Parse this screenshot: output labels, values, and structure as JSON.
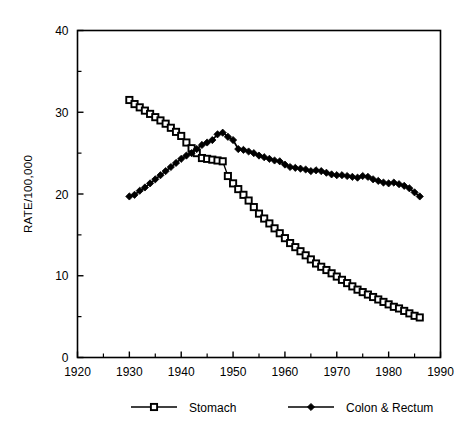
{
  "chart_data": {
    "type": "line",
    "title": "",
    "subtitle": "",
    "xlabel": "",
    "ylabel": "RATE/100,000",
    "xlim": [
      1920,
      1990
    ],
    "ylim": [
      0,
      40
    ],
    "x_ticks": [
      1920,
      1930,
      1940,
      1950,
      1960,
      1970,
      1980,
      1990
    ],
    "x_tick_labels": [
      "1920",
      "1930",
      "1940",
      "1950",
      "1960",
      "1970",
      "1980",
      "1990"
    ],
    "x_minor_ticks": [
      1925,
      1935,
      1945,
      1955,
      1965,
      1975,
      1985
    ],
    "y_ticks": [
      0,
      10,
      20,
      30,
      40
    ],
    "y_tick_labels": [
      "0",
      "10",
      "20",
      "30",
      "40"
    ],
    "y_minor_ticks": [
      5,
      15,
      25,
      35
    ],
    "grid": false,
    "legend_position": "bottom",
    "frame": "full-box",
    "series": [
      {
        "name": "Stomach",
        "marker": "open-square",
        "color": "#000000",
        "x": [
          1930,
          1931,
          1932,
          1933,
          1934,
          1935,
          1936,
          1937,
          1938,
          1939,
          1940,
          1941,
          1942,
          1943,
          1944,
          1945,
          1946,
          1947,
          1948,
          1949,
          1950,
          1951,
          1952,
          1953,
          1954,
          1955,
          1956,
          1957,
          1958,
          1959,
          1960,
          1961,
          1962,
          1963,
          1964,
          1965,
          1966,
          1967,
          1968,
          1969,
          1970,
          1971,
          1972,
          1973,
          1974,
          1975,
          1976,
          1977,
          1978,
          1979,
          1980,
          1981,
          1982,
          1983,
          1984,
          1985,
          1986
        ],
        "values": [
          31.5,
          31.0,
          30.6,
          30.2,
          29.8,
          29.4,
          29.0,
          28.6,
          28.1,
          27.6,
          27.1,
          26.3,
          25.6,
          25.0,
          24.4,
          24.3,
          24.2,
          24.1,
          24.0,
          22.2,
          21.3,
          20.6,
          19.9,
          19.2,
          18.4,
          17.6,
          17.0,
          16.4,
          15.8,
          15.2,
          14.6,
          14.0,
          13.5,
          13.0,
          12.5,
          12.0,
          11.5,
          11.1,
          10.7,
          10.3,
          9.9,
          9.5,
          9.1,
          8.7,
          8.3,
          8.0,
          7.7,
          7.4,
          7.1,
          6.8,
          6.5,
          6.2,
          6.0,
          5.7,
          5.4,
          5.1,
          4.9
        ]
      },
      {
        "name": "Colon & Rectum",
        "marker": "filled-diamond",
        "color": "#000000",
        "x": [
          1930,
          1931,
          1932,
          1933,
          1934,
          1935,
          1936,
          1937,
          1938,
          1939,
          1940,
          1941,
          1942,
          1943,
          1944,
          1945,
          1946,
          1947,
          1948,
          1949,
          1950,
          1951,
          1952,
          1953,
          1954,
          1955,
          1956,
          1957,
          1958,
          1959,
          1960,
          1961,
          1962,
          1963,
          1964,
          1965,
          1966,
          1967,
          1968,
          1969,
          1970,
          1971,
          1972,
          1973,
          1974,
          1975,
          1976,
          1977,
          1978,
          1979,
          1980,
          1981,
          1982,
          1983,
          1984,
          1985,
          1986
        ],
        "values": [
          19.7,
          19.9,
          20.4,
          20.8,
          21.3,
          21.8,
          22.3,
          22.8,
          23.3,
          23.8,
          24.3,
          24.7,
          25.0,
          25.5,
          26.0,
          26.3,
          26.6,
          27.3,
          27.5,
          27.0,
          26.6,
          25.5,
          25.4,
          25.2,
          25.0,
          24.7,
          24.5,
          24.3,
          24.1,
          24.0,
          23.6,
          23.3,
          23.2,
          23.1,
          23.0,
          22.8,
          22.9,
          22.8,
          22.6,
          22.4,
          22.3,
          22.3,
          22.2,
          22.1,
          22.0,
          22.2,
          22.1,
          21.8,
          21.6,
          21.4,
          21.3,
          21.4,
          21.2,
          21.0,
          20.7,
          20.2,
          19.7
        ]
      }
    ]
  },
  "legend": {
    "items": [
      {
        "label": "Stomach",
        "marker": "open-square"
      },
      {
        "label": "Colon & Rectum",
        "marker": "filled-diamond"
      }
    ]
  },
  "axes": {
    "y_axis_title": "RATE/100,000"
  }
}
